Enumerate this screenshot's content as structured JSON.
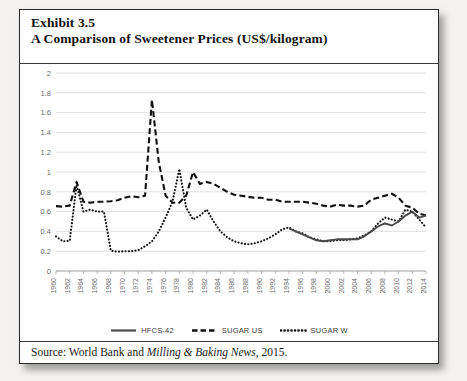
{
  "exhibit": {
    "number_line": "Exhibit 3.5",
    "title_line": "A Comparison of Sweetener Prices (US$/kilogram)",
    "source_prefix": "Source: World Bank and ",
    "source_italic": "Milling & Baking News",
    "source_suffix": ", 2015."
  },
  "legend": {
    "items": [
      {
        "label": "HFCS-42",
        "style": "solid",
        "color": "#4a4a4a",
        "name": "legend-hfcs-42"
      },
      {
        "label": "SUGAR US",
        "style": "dashed",
        "color": "#111111",
        "name": "legend-sugar-us"
      },
      {
        "label": "SUGAR W",
        "style": "dotted",
        "color": "#111111",
        "name": "legend-sugar-w"
      }
    ]
  },
  "chart_data": {
    "type": "line",
    "title": "A Comparison of Sweetener Prices (US$/kilogram)",
    "xlabel": "",
    "ylabel": "",
    "ylim": [
      0,
      2
    ],
    "ytick_step": 0.2,
    "yticks": [
      "0",
      "0.2",
      "0.4",
      "0.6",
      "0.8",
      "1",
      "1.2",
      "1.4",
      "1.6",
      "1.8",
      "2"
    ],
    "grid": "horizontal",
    "legend_position": "bottom",
    "xlim": [
      1960,
      2014
    ],
    "xticks": [
      "1960",
      "1962",
      "1964",
      "1966",
      "1968",
      "1970",
      "1972",
      "1974",
      "1976",
      "1978",
      "1980",
      "1982",
      "1984",
      "1986",
      "1988",
      "1990",
      "1992",
      "1994",
      "1996",
      "1998",
      "2000",
      "2002",
      "2004",
      "2006",
      "2008",
      "2010",
      "2012",
      "2014"
    ],
    "x": [
      1960,
      1961,
      1962,
      1963,
      1964,
      1965,
      1966,
      1967,
      1968,
      1969,
      1970,
      1971,
      1972,
      1973,
      1974,
      1975,
      1976,
      1977,
      1978,
      1979,
      1980,
      1981,
      1982,
      1983,
      1984,
      1985,
      1986,
      1987,
      1988,
      1989,
      1990,
      1991,
      1992,
      1993,
      1994,
      1995,
      1996,
      1997,
      1998,
      1999,
      2000,
      2001,
      2002,
      2003,
      2004,
      2005,
      2006,
      2007,
      2008,
      2009,
      2010,
      2011,
      2012,
      2013,
      2014
    ],
    "series": [
      {
        "name": "SUGAR US",
        "style": "dashed",
        "color": "#111111",
        "values": [
          0.655,
          0.65,
          0.66,
          0.9,
          0.7,
          0.69,
          0.7,
          0.7,
          0.705,
          0.715,
          0.74,
          0.755,
          0.745,
          0.76,
          1.73,
          1.1,
          0.76,
          0.69,
          0.69,
          0.76,
          1.0,
          0.88,
          0.9,
          0.88,
          0.84,
          0.8,
          0.77,
          0.76,
          0.75,
          0.74,
          0.74,
          0.72,
          0.72,
          0.7,
          0.7,
          0.7,
          0.7,
          0.69,
          0.68,
          0.66,
          0.65,
          0.67,
          0.66,
          0.66,
          0.65,
          0.66,
          0.72,
          0.74,
          0.76,
          0.78,
          0.74,
          0.66,
          0.64,
          0.58,
          0.56
        ]
      },
      {
        "name": "SUGAR W",
        "style": "dotted",
        "color": "#111111",
        "values": [
          0.35,
          0.3,
          0.305,
          0.87,
          0.6,
          0.62,
          0.6,
          0.6,
          0.205,
          0.195,
          0.2,
          0.2,
          0.21,
          0.25,
          0.3,
          0.4,
          0.54,
          0.7,
          1.03,
          0.64,
          0.52,
          0.56,
          0.62,
          0.5,
          0.4,
          0.34,
          0.3,
          0.28,
          0.27,
          0.28,
          0.3,
          0.33,
          0.37,
          0.42,
          0.44,
          0.4,
          0.38,
          0.34,
          0.32,
          0.3,
          0.3,
          0.31,
          0.31,
          0.32,
          0.33,
          0.36,
          0.4,
          0.48,
          0.54,
          0.52,
          0.5,
          0.62,
          0.6,
          0.52,
          0.44
        ]
      },
      {
        "name": "HFCS-42",
        "style": "solid",
        "color": "#4a4a4a",
        "values": [
          null,
          null,
          null,
          null,
          null,
          null,
          null,
          null,
          null,
          null,
          null,
          null,
          null,
          null,
          null,
          null,
          null,
          null,
          null,
          null,
          null,
          null,
          null,
          null,
          null,
          null,
          null,
          null,
          null,
          null,
          null,
          null,
          null,
          null,
          0.43,
          0.4,
          0.37,
          0.34,
          0.31,
          0.3,
          0.31,
          0.32,
          0.32,
          0.32,
          0.32,
          0.35,
          0.4,
          0.45,
          0.48,
          0.46,
          0.5,
          0.56,
          0.6,
          0.54,
          0.56
        ]
      }
    ]
  }
}
